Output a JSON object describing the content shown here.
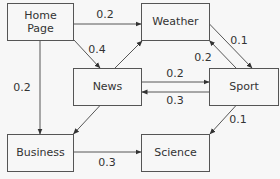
{
  "diagram": {
    "type": "state-transition",
    "nodes": [
      {
        "id": "home",
        "label_lines": [
          "Home",
          "Page"
        ]
      },
      {
        "id": "weather",
        "label_lines": [
          "Weather"
        ]
      },
      {
        "id": "news",
        "label_lines": [
          "News"
        ]
      },
      {
        "id": "sport",
        "label_lines": [
          "Sport"
        ]
      },
      {
        "id": "business",
        "label_lines": [
          "Business"
        ]
      },
      {
        "id": "science",
        "label_lines": [
          "Science"
        ]
      }
    ],
    "edges": [
      {
        "from": "home",
        "to": "weather",
        "label": "0.2"
      },
      {
        "from": "home",
        "to": "news",
        "label": "0.4"
      },
      {
        "from": "home",
        "to": "business",
        "label": "0.2"
      },
      {
        "from": "news",
        "to": "weather",
        "label": ""
      },
      {
        "from": "news",
        "to": "sport",
        "label": "0.2"
      },
      {
        "from": "sport",
        "to": "news",
        "label": "0.3"
      },
      {
        "from": "news",
        "to": "business",
        "label": ""
      },
      {
        "from": "weather",
        "to": "sport",
        "label": "0.1"
      },
      {
        "from": "sport",
        "to": "weather",
        "label": "0.2"
      },
      {
        "from": "sport",
        "to": "science",
        "label": "0.1"
      },
      {
        "from": "business",
        "to": "science",
        "label": "0.3"
      }
    ]
  }
}
